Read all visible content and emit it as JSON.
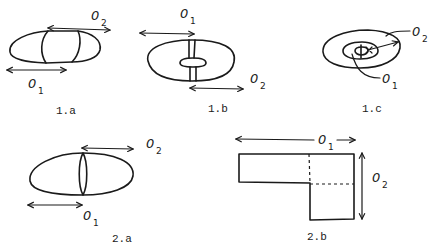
{
  "figures": [
    {
      "id": "1a",
      "caption": "1.a",
      "labels": [
        {
          "base": "0",
          "sub": "1"
        },
        {
          "base": "0",
          "sub": "2"
        }
      ]
    },
    {
      "id": "1b",
      "caption": "1.b",
      "labels": [
        {
          "base": "0",
          "sub": "1"
        },
        {
          "base": "0",
          "sub": "2"
        }
      ]
    },
    {
      "id": "1c",
      "caption": "1.c",
      "labels": [
        {
          "base": "0",
          "sub": "1"
        },
        {
          "base": "0",
          "sub": "2"
        }
      ]
    },
    {
      "id": "2a",
      "caption": "2.a",
      "labels": [
        {
          "base": "0",
          "sub": "1"
        },
        {
          "base": "0",
          "sub": "2"
        }
      ]
    },
    {
      "id": "2b",
      "caption": "2.b",
      "labels": [
        {
          "base": "0",
          "sub": "1"
        },
        {
          "base": "0",
          "sub": "2"
        }
      ]
    }
  ],
  "colors": {
    "ink": "#1a1a1a",
    "background": "#ffffff"
  }
}
